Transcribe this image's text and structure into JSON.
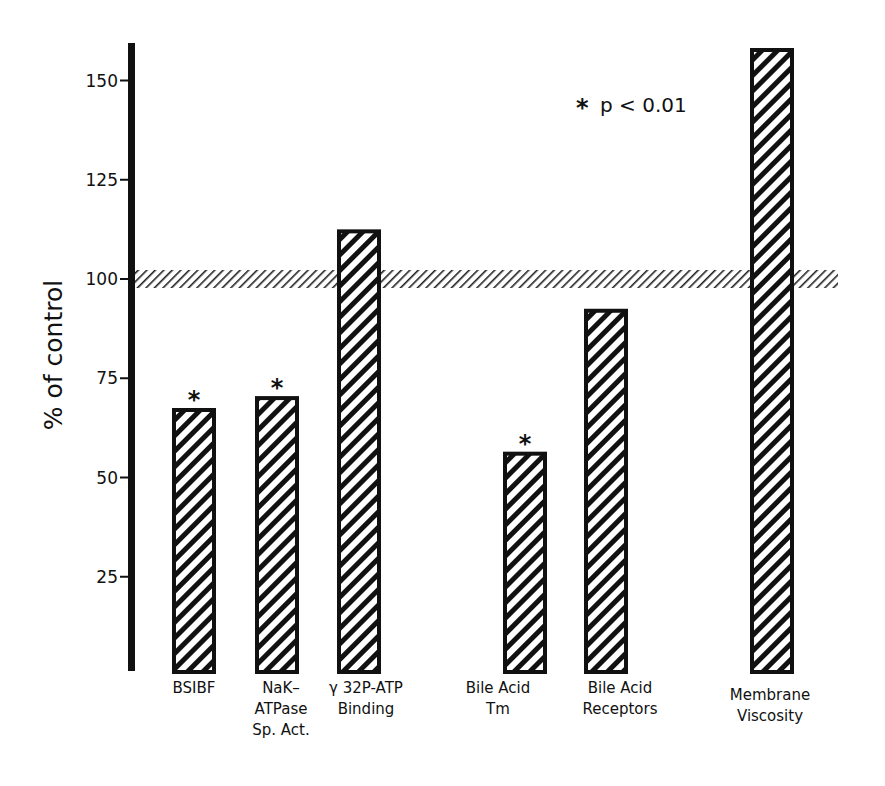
{
  "chart_data": {
    "type": "bar",
    "title": "",
    "xlabel": "",
    "ylabel": "% of control",
    "ylim": [
      0,
      158
    ],
    "yticks": [
      25,
      50,
      75,
      100,
      125,
      150
    ],
    "ytick_labels": [
      "25",
      "50",
      "75",
      "100",
      "125",
      "150"
    ],
    "grid": false,
    "reference_band": {
      "value": 100,
      "range": [
        98,
        102
      ],
      "style": "hatched"
    },
    "categories": [
      "BSIBF",
      "NaK-ATPase Sp. Act.",
      "γ 32P-ATP Binding",
      "Bile Acid Tm",
      "Bile Acid Receptors",
      "Membrane Viscosity"
    ],
    "category_label_lines": [
      [
        "BSIBF"
      ],
      [
        "NaK–",
        "ATPase",
        "Sp. Act."
      ],
      [
        "γ 32P-ATP",
        "Binding"
      ],
      [
        "Bile Acid",
        "Tm"
      ],
      [
        "Bile Acid",
        "Receptors"
      ],
      [
        "Membrane",
        "Viscosity"
      ]
    ],
    "values": [
      67,
      70,
      112,
      56,
      92,
      158
    ],
    "significant": [
      true,
      true,
      false,
      true,
      false,
      false
    ],
    "annotation": "* p < 0.01",
    "bar_style": "black outline, diagonal hatch"
  },
  "legend": {
    "star": "*",
    "text": "p < 0.01"
  },
  "axis": {
    "ylabel": "% of control",
    "ticks": [
      "150",
      "125",
      "100",
      "75",
      "50",
      "25"
    ]
  },
  "colors": {
    "ink": "#111111",
    "background": "#ffffff"
  }
}
